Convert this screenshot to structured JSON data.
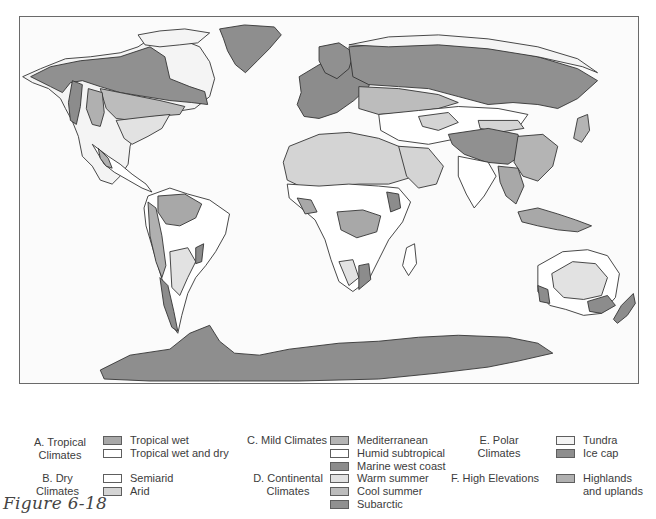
{
  "figure": {
    "caption": "Figure 6-18",
    "map_title": "World climate regions"
  },
  "colors": {
    "tropical_wet": "#a8a8a8",
    "tropical_wet_dry": "#ffffff",
    "semiarid": "#ffffff",
    "arid": "#d4d4d4",
    "mediterranean": "#b4b4b4",
    "humid_subtropical": "#ffffff",
    "marine_west_coast": "#8c8c8c",
    "warm_summer": "#e2e2e2",
    "cool_summer": "#bcbcbc",
    "subarctic": "#909090",
    "tundra": "#f4f4f4",
    "ice_cap": "#8e8e8e",
    "highlands": "#b0b0b0",
    "ocean": "#fbfbfb",
    "border": "#333333"
  },
  "legend": {
    "groups": [
      {
        "title": "A. Tropical\nClimates",
        "title_line1": "A. Tropical",
        "title_line2": "Climates",
        "items": [
          {
            "label": "Tropical wet",
            "color_key": "tropical_wet"
          },
          {
            "label": "Tropical wet and dry",
            "color_key": "tropical_wet_dry"
          }
        ]
      },
      {
        "title_line1": "B. Dry Climates",
        "items": [
          {
            "label": "Semiarid",
            "color_key": "semiarid"
          },
          {
            "label": "Arid",
            "color_key": "arid"
          }
        ]
      },
      {
        "title_line1": "C. Mild Climates",
        "items": [
          {
            "label": "Mediterranean",
            "color_key": "mediterranean"
          },
          {
            "label": "Humid subtropical",
            "color_key": "humid_subtropical"
          },
          {
            "label": "Marine west coast",
            "color_key": "marine_west_coast"
          }
        ]
      },
      {
        "title_line1": "D. Continental",
        "title_line2": "Climates",
        "items": [
          {
            "label": "Warm summer",
            "color_key": "warm_summer"
          },
          {
            "label": "Cool summer",
            "color_key": "cool_summer"
          },
          {
            "label": "Subarctic",
            "color_key": "subarctic"
          }
        ]
      },
      {
        "title_line1": "E. Polar Climates",
        "items": [
          {
            "label": "Tundra",
            "color_key": "tundra"
          },
          {
            "label": "Ice cap",
            "color_key": "ice_cap"
          }
        ]
      },
      {
        "title_line1": "F. High Elevations",
        "items": [
          {
            "label_line1": "Highlands",
            "label_line2": "and uplands",
            "color_key": "highlands"
          }
        ]
      }
    ]
  }
}
